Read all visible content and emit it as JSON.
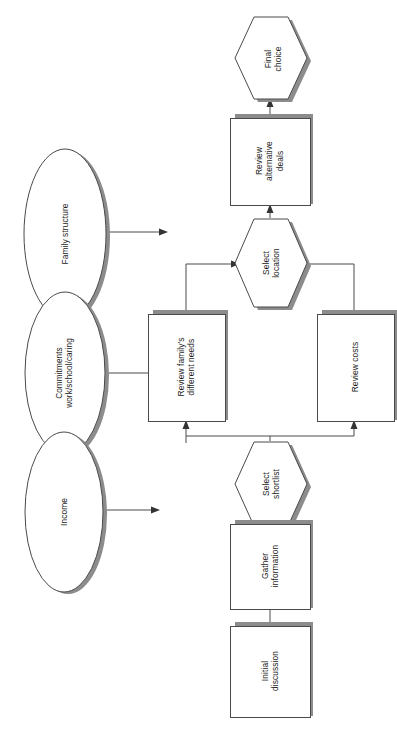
{
  "diagram": {
    "orientation": "rotated-90",
    "colors": {
      "outline": "#4a4a4a",
      "shadow": "#8c8c8c",
      "fill": "#ffffff",
      "text": "#1a1a1a",
      "connector": "#4a4a4a"
    },
    "process_nodes": [
      {
        "id": "initial-discussion",
        "shape": "rectangle",
        "lines": [
          "Initial",
          "discussion"
        ]
      },
      {
        "id": "gather-information",
        "shape": "rectangle",
        "lines": [
          "Gather",
          "information"
        ]
      },
      {
        "id": "select-shortlist",
        "shape": "hexagon",
        "lines": [
          "Select",
          "shortlist"
        ]
      },
      {
        "id": "review-family-needs",
        "shape": "rectangle",
        "lines": [
          "Review family's",
          "different needs"
        ]
      },
      {
        "id": "review-costs",
        "shape": "rectangle",
        "lines": [
          "Review costs"
        ]
      },
      {
        "id": "select-location",
        "shape": "hexagon",
        "lines": [
          "Select",
          "location"
        ]
      },
      {
        "id": "review-alternative-deals",
        "shape": "rectangle",
        "lines": [
          "Review",
          "alternative",
          "deals"
        ]
      },
      {
        "id": "final-choice",
        "shape": "hexagon",
        "lines": [
          "Final",
          "choice"
        ]
      }
    ],
    "factor_nodes": [
      {
        "id": "income",
        "shape": "ellipse",
        "lines": [
          "Income"
        ]
      },
      {
        "id": "commitments",
        "shape": "ellipse",
        "lines": [
          "Commitments",
          "work/school/caring"
        ]
      },
      {
        "id": "family-structure",
        "shape": "ellipse",
        "lines": [
          "Family structure"
        ]
      }
    ],
    "edges": [
      {
        "from": "initial-discussion",
        "to": "gather-information"
      },
      {
        "from": "gather-information",
        "to": "select-shortlist"
      },
      {
        "from": "select-shortlist",
        "to": "review-family-needs"
      },
      {
        "from": "select-shortlist",
        "to": "review-costs"
      },
      {
        "from": "review-family-needs",
        "to": "select-location"
      },
      {
        "from": "review-costs",
        "to": "select-location"
      },
      {
        "from": "select-location",
        "to": "review-alternative-deals"
      },
      {
        "from": "review-alternative-deals",
        "to": "final-choice"
      },
      {
        "from": "income",
        "to": ""
      },
      {
        "from": "commitments",
        "to": "review-family-needs"
      },
      {
        "from": "family-structure",
        "to": ""
      }
    ]
  }
}
